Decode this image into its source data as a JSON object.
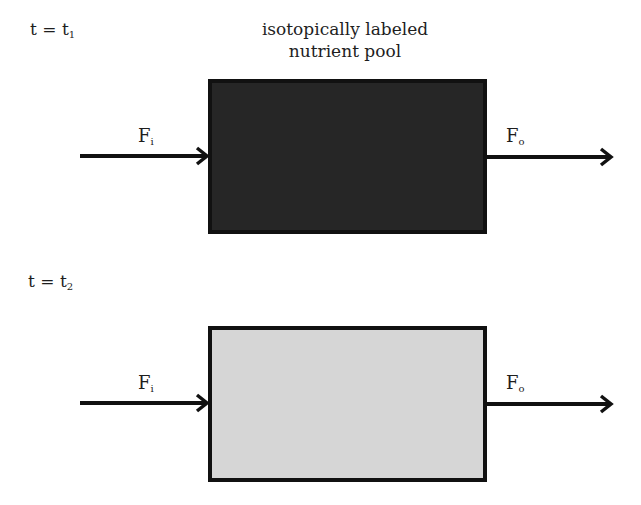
{
  "diagram": {
    "title_lines": [
      "isotopically labeled",
      "nutrient pool"
    ],
    "panels": [
      {
        "time_label": "t = t",
        "time_subscript": "1",
        "pool_fill": "#262626",
        "inflow_label": "F",
        "inflow_subscript": "i",
        "outflow_label": "F",
        "outflow_subscript": "o"
      },
      {
        "time_label": "t = t",
        "time_subscript": "2",
        "pool_fill": "#d6d6d6",
        "inflow_label": "F",
        "inflow_subscript": "i",
        "outflow_label": "F",
        "outflow_subscript": "o"
      }
    ],
    "colors": {
      "stroke": "#111111",
      "labeled_pool": "#262626",
      "unlabeled_pool": "#d6d6d6"
    }
  }
}
